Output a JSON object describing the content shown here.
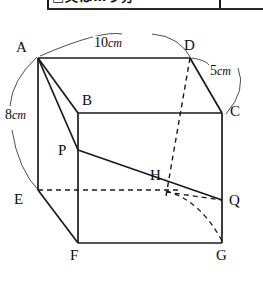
{
  "header": {
    "boxed_text": "□又は…う分",
    "has_rule": true
  },
  "figure": {
    "type": "cuboid-geometry-diagram",
    "vertices": [
      {
        "id": "A",
        "label": "A",
        "x": 38,
        "y": 58,
        "label_x": 16,
        "label_y": 40
      },
      {
        "id": "B",
        "label": "B",
        "x": 78,
        "y": 113,
        "label_x": 82,
        "label_y": 93
      },
      {
        "id": "C",
        "label": "C",
        "x": 222,
        "y": 113,
        "label_x": 230,
        "label_y": 104
      },
      {
        "id": "D",
        "label": "D",
        "x": 190,
        "y": 58,
        "label_x": 184,
        "label_y": 38
      },
      {
        "id": "E",
        "label": "E",
        "x": 38,
        "y": 190,
        "label_x": 14,
        "label_y": 192
      },
      {
        "id": "F",
        "label": "F",
        "x": 78,
        "y": 243,
        "label_x": 70,
        "label_y": 248
      },
      {
        "id": "G",
        "label": "G",
        "x": 222,
        "y": 243,
        "label_x": 216,
        "label_y": 248
      },
      {
        "id": "H",
        "label": "H",
        "x": 166,
        "y": 188,
        "label_x": 150,
        "label_y": 168
      },
      {
        "id": "P",
        "label": "P",
        "x": 78,
        "y": 150,
        "label_x": 58,
        "label_y": 143
      },
      {
        "id": "Q",
        "label": "Q",
        "x": 222,
        "y": 200,
        "label_x": 229,
        "label_y": 193
      }
    ],
    "dimensions": [
      {
        "id": "top",
        "value": "10",
        "unit": "cm",
        "x": 93,
        "y": 36,
        "edge": "A-D"
      },
      {
        "id": "left",
        "value": "8",
        "unit": "cm",
        "x": 4,
        "y": 108,
        "edge": "A-E"
      },
      {
        "id": "right",
        "value": "5",
        "unit": "cm",
        "x": 209,
        "y": 64,
        "edge": "D-C"
      }
    ],
    "solid_edges": [
      {
        "from": "A",
        "to": "D"
      },
      {
        "from": "A",
        "to": "E"
      },
      {
        "from": "A",
        "to": "B"
      },
      {
        "from": "A",
        "to": "P"
      },
      {
        "from": "B",
        "to": "C"
      },
      {
        "from": "B",
        "to": "F"
      },
      {
        "from": "D",
        "to": "C"
      },
      {
        "from": "C",
        "to": "G"
      },
      {
        "from": "E",
        "to": "F"
      },
      {
        "from": "F",
        "to": "G"
      },
      {
        "from": "P",
        "to": "Q"
      }
    ],
    "dashed_edges": [
      {
        "from": "D",
        "to": "H-vertical",
        "note": "D down to base hidden corner"
      },
      {
        "from": "E",
        "to": "H-horizontal",
        "note": "E across hidden back edge"
      },
      {
        "from": "H",
        "to": "G",
        "note": "hidden diagonal"
      },
      {
        "from": "H",
        "to": "Q",
        "note": "hidden short segment"
      }
    ],
    "arcs": [
      {
        "id": "arc-top",
        "label_ref": "top"
      },
      {
        "id": "arc-left",
        "label_ref": "left"
      },
      {
        "id": "arc-right",
        "label_ref": "right"
      }
    ],
    "stroke_color": "#1a1a1a"
  }
}
